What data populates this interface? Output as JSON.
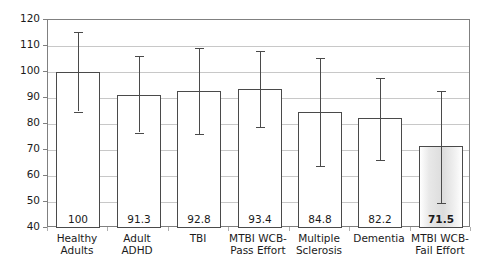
{
  "chart_data": {
    "type": "bar",
    "title": "",
    "subtitle": "",
    "xlabel": "",
    "ylabel": "",
    "ylim": [
      40,
      120
    ],
    "ytick_step": 10,
    "yticks": [
      "40",
      "50",
      "60",
      "70",
      "80",
      "90",
      "100",
      "110",
      "120"
    ],
    "grid": true,
    "legend": null,
    "orientation": "vertical",
    "categories": [
      "Healthy Adults",
      "Adult ADHD",
      "TBI",
      "MTBI WCB-Pass Effort",
      "Multiple Sclerosis",
      "Dementia",
      "MTBI WCB-Fail Effort"
    ],
    "category_lines": [
      [
        "Healthy",
        "Adults"
      ],
      [
        "Adult ADHD",
        ""
      ],
      [
        "TBI",
        ""
      ],
      [
        "MTBI WCB-",
        "Pass Effort"
      ],
      [
        "Multiple",
        "Sclerosis"
      ],
      [
        "Dementia",
        ""
      ],
      [
        "MTBI WCB-",
        "Fail Effort"
      ]
    ],
    "values": [
      100,
      91.3,
      92.8,
      93.4,
      84.8,
      82.2,
      71.5
    ],
    "value_labels": [
      "100",
      "91.3",
      "92.8",
      "93.4",
      "84.8",
      "82.2",
      "71.5"
    ],
    "error_low": [
      84.8,
      76.6,
      76.1,
      78.7,
      63.9,
      66.2,
      49.8
    ],
    "error_high": [
      115.3,
      106.0,
      109.4,
      108.1,
      105.3,
      97.8,
      92.7
    ],
    "highlight_index": 6,
    "bar_fill": "#ffffff",
    "bar_highlight_fill": "#e0e0e0",
    "bar_border_color": "#4a4a4a",
    "gridline_color": "#c8c8c8",
    "axis_color": "#808080",
    "text_color": "#1a1a1a",
    "background": "#ffffff"
  }
}
